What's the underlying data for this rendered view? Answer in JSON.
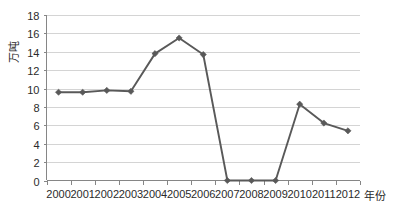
{
  "chart_data": {
    "type": "line",
    "title": "",
    "subtitle": "",
    "xlabel": "年份",
    "ylabel": "万吨",
    "categories": [
      "2000",
      "2001",
      "2002",
      "2003",
      "2004",
      "2005",
      "2006",
      "2007",
      "2008",
      "2009",
      "2010",
      "2011",
      "2012"
    ],
    "values": [
      9.6,
      9.6,
      9.8,
      9.7,
      13.8,
      15.5,
      13.7,
      0,
      0,
      0,
      8.3,
      6.25,
      5.4
    ],
    "series": [
      {
        "name": "",
        "values": [
          9.6,
          9.6,
          9.8,
          9.7,
          13.8,
          15.5,
          13.7,
          0,
          0,
          0,
          8.3,
          6.25,
          5.4
        ]
      }
    ],
    "ylim": [
      0,
      18
    ],
    "ytick_step": 2,
    "yticks": [
      "0",
      "2",
      "4",
      "6",
      "8",
      "10",
      "12",
      "14",
      "16",
      "18"
    ],
    "xticks": [
      "2000",
      "2001",
      "2002",
      "2003",
      "2004",
      "2005",
      "2006",
      "2007",
      "2008",
      "2009",
      "2010",
      "2011",
      "2012"
    ],
    "grid": "horizontal",
    "legend": "none",
    "marker": "diamond",
    "colors": {
      "line": "#595959",
      "marker": "#595959",
      "gridline": "#d4d4d4",
      "axis": "#868686",
      "text": "#2b2b2b",
      "background": "#ffffff"
    }
  }
}
